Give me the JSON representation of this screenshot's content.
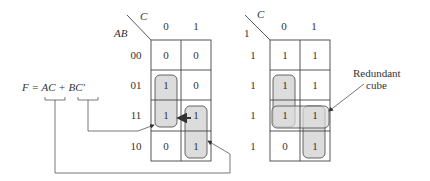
{
  "equation": {
    "text": "F = AC + BC'",
    "terms": [
      "AC",
      "BC'"
    ]
  },
  "left_map": {
    "col_var": "C",
    "row_var": "AB",
    "col_labels": [
      "0",
      "1"
    ],
    "row_labels": [
      "00",
      "01",
      "11",
      "10"
    ],
    "cells": [
      [
        "0",
        "0"
      ],
      [
        "1",
        "0"
      ],
      [
        "1",
        "1"
      ],
      [
        "0",
        "1"
      ]
    ],
    "groups": [
      {
        "name": "BC'",
        "cells": [
          [
            1,
            0
          ],
          [
            2,
            0
          ]
        ]
      },
      {
        "name": "AC",
        "cells": [
          [
            2,
            1
          ],
          [
            3,
            1
          ]
        ]
      }
    ]
  },
  "right_map": {
    "col_var": "C",
    "row_var": "1",
    "col_labels": [
      "0",
      "1"
    ],
    "row_labels": [
      "1",
      "1",
      "1",
      "1"
    ],
    "cells": [
      [
        "1",
        "1"
      ],
      [
        "1",
        "1"
      ],
      [
        "1",
        "1"
      ],
      [
        "0",
        "1"
      ]
    ],
    "groups": [
      {
        "name": "BC'",
        "cells": [
          [
            1,
            0
          ],
          [
            2,
            0
          ]
        ]
      },
      {
        "name": "AC",
        "cells": [
          [
            2,
            1
          ],
          [
            3,
            1
          ]
        ]
      },
      {
        "name": "redundant",
        "cells": [
          [
            2,
            0
          ],
          [
            2,
            1
          ]
        ]
      }
    ]
  },
  "annotation": {
    "redundant_label_line1": "Redundant",
    "redundant_label_line2": "cube"
  }
}
